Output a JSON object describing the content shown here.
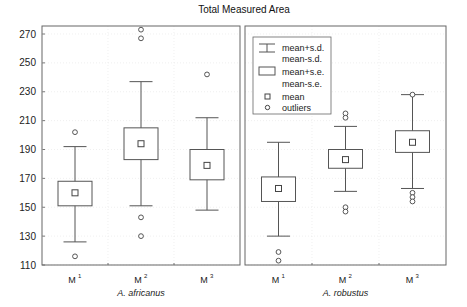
{
  "chart_data": {
    "type": "box",
    "title": "Total Measured Area",
    "xlabel": "",
    "ylabel": "",
    "ylim": [
      110,
      275
    ],
    "yticks": [
      110,
      130,
      150,
      170,
      190,
      210,
      230,
      250,
      270
    ],
    "grid": true,
    "legend": {
      "position": "upper-left of right panel",
      "entries": [
        {
          "symbol": "whisker",
          "label1": "mean+s.d.",
          "label2": "mean-s.d."
        },
        {
          "symbol": "box",
          "label1": "mean+s.e.",
          "label2": "mean-s.e."
        },
        {
          "symbol": "square",
          "label1": "mean"
        },
        {
          "symbol": "circle",
          "label1": "outliers"
        }
      ]
    },
    "panels": [
      {
        "group": "A. africanus",
        "categories": [
          {
            "label": "M",
            "sup": "1",
            "mean": 160,
            "se_hi": 168,
            "se_lo": 151,
            "sd_hi": 192,
            "sd_lo": 126,
            "outliers": [
              202,
              116
            ]
          },
          {
            "label": "M",
            "sup": "2",
            "mean": 194,
            "se_hi": 205,
            "se_lo": 183,
            "sd_hi": 237,
            "sd_lo": 151,
            "outliers": [
              273,
              267,
              143,
              130
            ]
          },
          {
            "label": "M",
            "sup": "3",
            "mean": 179,
            "se_hi": 190,
            "se_lo": 169,
            "sd_hi": 212,
            "sd_lo": 148,
            "outliers": [
              242
            ]
          }
        ]
      },
      {
        "group": "A. robustus",
        "categories": [
          {
            "label": "M",
            "sup": "1",
            "mean": 163,
            "se_hi": 171,
            "se_lo": 154,
            "sd_hi": 195,
            "sd_lo": 130,
            "outliers": [
              119,
              113
            ]
          },
          {
            "label": "M",
            "sup": "2",
            "mean": 183,
            "se_hi": 190,
            "se_lo": 177,
            "sd_hi": 206,
            "sd_lo": 161,
            "outliers": [
              215,
              212,
              150,
              147
            ]
          },
          {
            "label": "M",
            "sup": "3",
            "mean": 195,
            "se_hi": 203,
            "se_lo": 188,
            "sd_hi": 228,
            "sd_lo": 163,
            "outliers": [
              228,
              160,
              157,
              154
            ]
          }
        ]
      }
    ]
  }
}
